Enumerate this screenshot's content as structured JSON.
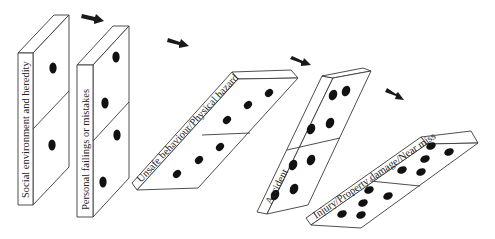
{
  "diagram": {
    "type": "domino-sequence",
    "dominoes": [
      {
        "label": "Social environment and heredity",
        "pips": [
          1,
          1
        ]
      },
      {
        "label": "Personal failings or mistakes",
        "pips": [
          2,
          2
        ]
      },
      {
        "label": "Unsafe behaviour/Physical hazard",
        "pips": [
          3,
          3
        ]
      },
      {
        "label": "Accident",
        "pips": [
          4,
          4
        ]
      },
      {
        "label": "Injury/Property damage/Near miss",
        "pips": [
          5,
          5
        ]
      }
    ],
    "arrows": 4,
    "colors": {
      "stroke": "#3a3a3a",
      "pip": "#111111",
      "arrow": "#1a1a1a",
      "background": "#ffffff"
    }
  }
}
